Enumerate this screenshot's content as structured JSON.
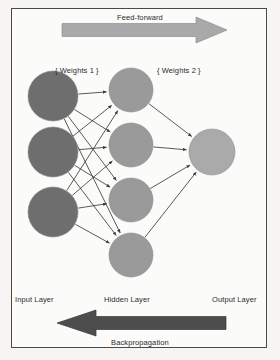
{
  "figure": {
    "background_color": "#fbfbfa",
    "border_color": "#4a4a4a"
  },
  "labels": {
    "feed_forward": "Feed-forward",
    "backpropagation": "Backpropagation",
    "weights_1": "{ Weights 1 }",
    "weights_2": "{ Weights 2 }",
    "input_layer": "Input Layer",
    "hidden_layer": "Hidden Layer",
    "output_layer": "Output Layer"
  },
  "arrows": {
    "feed_forward": {
      "direction": "right",
      "color": "#a9a9a9",
      "stroke": "#8f8f8f",
      "shaft_x_start": 62,
      "shaft_x_end": 196,
      "tip_x": 227,
      "center_y": 30
    },
    "backpropagation": {
      "direction": "left",
      "color": "#4d4d4d",
      "stroke": "#3a3a3a",
      "shaft_x_start": 96,
      "shaft_x_end": 226,
      "tip_x": 57,
      "center_y": 323
    }
  },
  "network": {
    "node_colors": {
      "input": "#6e6e6e",
      "hidden": "#9a9a9a",
      "output": "#aaaaaa"
    },
    "node_stroke": "#8a8a8a",
    "edge_color": "#3c3c3c",
    "layers": [
      {
        "name": "input",
        "label": "Input Layer",
        "count": 3,
        "radius": 25,
        "cx": 53,
        "cy": [
          96,
          152,
          212
        ]
      },
      {
        "name": "hidden",
        "label": "Hidden Layer",
        "count": 4,
        "radius": 22,
        "cx": 131,
        "cy": [
          90,
          145,
          200,
          255
        ]
      },
      {
        "name": "output",
        "label": "Output Layer",
        "count": 1,
        "radius": 23,
        "cx": 212,
        "cy": [
          152
        ]
      }
    ],
    "connections": [
      {
        "from_layer": "input",
        "to_layer": "hidden",
        "type": "fully-connected",
        "count": 12
      },
      {
        "from_layer": "hidden",
        "to_layer": "output",
        "type": "fully-connected",
        "count": 4
      }
    ]
  }
}
